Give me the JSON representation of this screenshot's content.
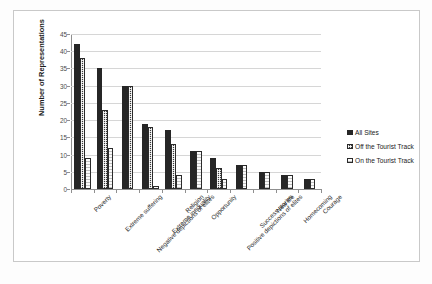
{
  "chart_data": {
    "type": "bar",
    "title": "",
    "xlabel": "",
    "ylabel": "Number of Representations",
    "ylim": [
      0,
      45
    ],
    "yticks": [
      0,
      5,
      10,
      15,
      20,
      25,
      30,
      35,
      40,
      45
    ],
    "grid": true,
    "legend_position": "right",
    "categories": [
      "Poverty",
      "Extreme suffering",
      "Negative depictions of elites",
      "Extreme inequality",
      "Religion",
      "Opportunity",
      "Positive depictions of elites",
      "Success stories",
      "New life",
      "Homecoming",
      "Courage"
    ],
    "series": [
      {
        "name": "All Sites",
        "fill": "solid-dark",
        "color": "#262626",
        "values": [
          42,
          35,
          30,
          19,
          17,
          11,
          9,
          7,
          5,
          4,
          3
        ]
      },
      {
        "name": "Off the Tourist Track",
        "fill": "checkered",
        "color": "#3a3a3a",
        "values": [
          38,
          23,
          30,
          18,
          13,
          0,
          6,
          0,
          0,
          0,
          0
        ]
      },
      {
        "name": "On the Tourist Track",
        "fill": "outlined-light",
        "color": "#fbfbfb",
        "values": [
          9,
          12,
          0,
          1,
          4,
          11,
          3,
          7,
          5,
          4,
          3
        ]
      }
    ]
  },
  "legend": {
    "items": [
      {
        "label": "All Sites"
      },
      {
        "label": "Off the Tourist Track"
      },
      {
        "label": "On the Tourist Track"
      }
    ]
  }
}
